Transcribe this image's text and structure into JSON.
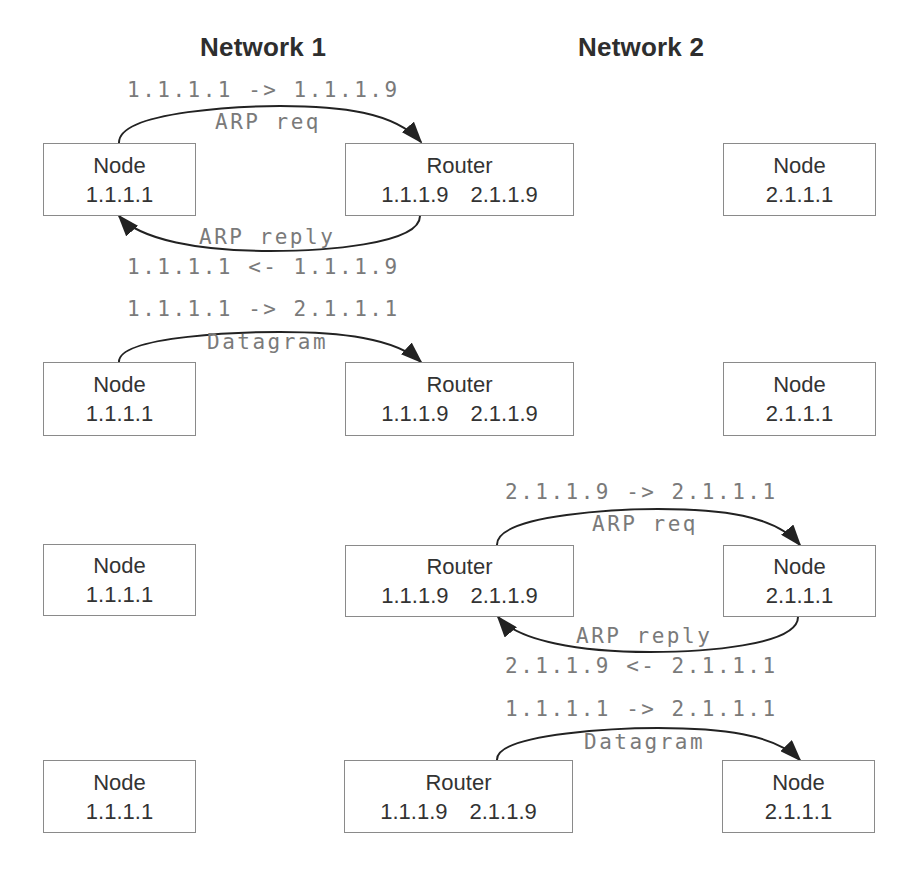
{
  "headings": {
    "network1": "Network 1",
    "network2": "Network 2"
  },
  "steps": [
    {
      "left_node": {
        "label": "Node",
        "addr": "1.1.1.1"
      },
      "router": {
        "label": "Router",
        "addr1": "1.1.1.9",
        "addr2": "2.1.1.9"
      },
      "right_node": {
        "label": "Node",
        "addr": "2.1.1.1"
      },
      "top_arrow": {
        "address_label": "1.1.1.1 -> 1.1.1.9",
        "message": "ARP req",
        "from": "left_node",
        "to": "router"
      },
      "bottom_arrow": {
        "address_label": "1.1.1.1 <- 1.1.1.9",
        "message": "ARP reply",
        "from": "router",
        "to": "left_node"
      }
    },
    {
      "left_node": {
        "label": "Node",
        "addr": "1.1.1.1"
      },
      "router": {
        "label": "Router",
        "addr1": "1.1.1.9",
        "addr2": "2.1.1.9"
      },
      "right_node": {
        "label": "Node",
        "addr": "2.1.1.1"
      },
      "top_arrow": {
        "address_label": "1.1.1.1 -> 2.1.1.1",
        "message": "Datagram",
        "from": "left_node",
        "to": "router"
      }
    },
    {
      "left_node": {
        "label": "Node",
        "addr": "1.1.1.1"
      },
      "router": {
        "label": "Router",
        "addr1": "1.1.1.9",
        "addr2": "2.1.1.9"
      },
      "right_node": {
        "label": "Node",
        "addr": "2.1.1.1"
      },
      "top_arrow": {
        "address_label": "2.1.1.9 -> 2.1.1.1",
        "message": "ARP req",
        "from": "router",
        "to": "right_node"
      },
      "bottom_arrow": {
        "address_label": "2.1.1.9 <- 2.1.1.1",
        "message": "ARP reply",
        "from": "right_node",
        "to": "router"
      }
    },
    {
      "left_node": {
        "label": "Node",
        "addr": "1.1.1.1"
      },
      "router": {
        "label": "Router",
        "addr1": "1.1.1.9",
        "addr2": "2.1.1.9"
      },
      "right_node": {
        "label": "Node",
        "addr": "2.1.1.1"
      },
      "top_arrow": {
        "address_label": "1.1.1.1 -> 2.1.1.1",
        "message": "Datagram",
        "from": "router",
        "to": "right_node"
      }
    }
  ],
  "colors": {
    "box_border": "#8a8a8a",
    "text": "#333333",
    "mono_text": "#7a7a7a",
    "arrow": "#222222"
  }
}
